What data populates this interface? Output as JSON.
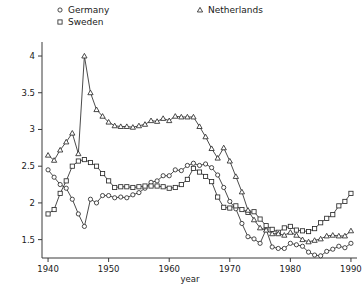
{
  "chart_data": {
    "type": "line",
    "title": "",
    "xlabel": "year",
    "ylabel": "",
    "xlim": [
      1939,
      1991
    ],
    "ylim": [
      1.25,
      4.15
    ],
    "xticks": [
      1940,
      1950,
      1960,
      1970,
      1980,
      1990
    ],
    "xtick_labels": [
      "1940",
      "1950",
      "1960",
      "1970",
      "1980",
      "1990"
    ],
    "yticks": [
      1.5,
      2,
      2.5,
      3,
      3.5,
      4
    ],
    "ytick_labels": [
      "1.5",
      "2",
      "2.5",
      "3",
      "3.5",
      "4"
    ],
    "grid": false,
    "legend_position": "top",
    "x": [
      1940,
      1941,
      1942,
      1943,
      1944,
      1945,
      1946,
      1947,
      1948,
      1949,
      1950,
      1951,
      1952,
      1953,
      1954,
      1955,
      1956,
      1957,
      1958,
      1959,
      1960,
      1961,
      1962,
      1963,
      1964,
      1965,
      1966,
      1967,
      1968,
      1969,
      1970,
      1971,
      1972,
      1973,
      1974,
      1975,
      1976,
      1977,
      1978,
      1979,
      1980,
      1981,
      1982,
      1983,
      1984,
      1985,
      1986,
      1987,
      1988,
      1989,
      1990
    ],
    "series": [
      {
        "name": "Germany",
        "marker": "circle",
        "values": [
          2.45,
          2.35,
          2.25,
          2.2,
          2.05,
          1.85,
          1.68,
          2.05,
          2.0,
          2.1,
          2.1,
          2.07,
          2.08,
          2.07,
          2.11,
          2.14,
          2.2,
          2.28,
          2.3,
          2.37,
          2.37,
          2.45,
          2.44,
          2.51,
          2.54,
          2.51,
          2.53,
          2.48,
          2.38,
          2.21,
          2.02,
          1.92,
          1.72,
          1.54,
          1.51,
          1.45,
          1.64,
          1.4,
          1.38,
          1.38,
          1.45,
          1.43,
          1.41,
          1.33,
          1.29,
          1.28,
          1.34,
          1.37,
          1.41,
          1.39,
          1.45
        ]
      },
      {
        "name": "Sweden",
        "marker": "square",
        "values": [
          1.85,
          1.91,
          2.13,
          2.3,
          2.5,
          2.57,
          2.59,
          2.55,
          2.5,
          2.4,
          2.3,
          2.21,
          2.22,
          2.22,
          2.21,
          2.22,
          2.23,
          2.23,
          2.23,
          2.22,
          2.2,
          2.21,
          2.25,
          2.32,
          2.47,
          2.42,
          2.36,
          2.29,
          2.08,
          1.94,
          1.93,
          1.96,
          1.91,
          1.87,
          1.88,
          1.78,
          1.69,
          1.64,
          1.6,
          1.66,
          1.68,
          1.63,
          1.62,
          1.61,
          1.65,
          1.73,
          1.79,
          1.84,
          1.96,
          2.02,
          2.13
        ]
      },
      {
        "name": "Netherlands",
        "marker": "triangle",
        "values": [
          2.65,
          2.58,
          2.72,
          2.83,
          2.95,
          2.67,
          4.0,
          3.5,
          3.27,
          3.18,
          3.1,
          3.05,
          3.04,
          3.04,
          3.03,
          3.05,
          3.07,
          3.12,
          3.11,
          3.15,
          3.12,
          3.18,
          3.17,
          3.17,
          3.17,
          3.04,
          2.9,
          2.74,
          2.61,
          2.75,
          2.57,
          2.36,
          2.15,
          1.9,
          1.77,
          1.66,
          1.63,
          1.58,
          1.58,
          1.56,
          1.6,
          1.56,
          1.5,
          1.47,
          1.49,
          1.51,
          1.55,
          1.56,
          1.55,
          1.55,
          1.62
        ]
      }
    ]
  },
  "legend": {
    "entries": [
      {
        "label": "Germany",
        "marker": "circle"
      },
      {
        "label": "Sweden",
        "marker": "square"
      },
      {
        "label": "Netherlands",
        "marker": "triangle"
      }
    ]
  }
}
